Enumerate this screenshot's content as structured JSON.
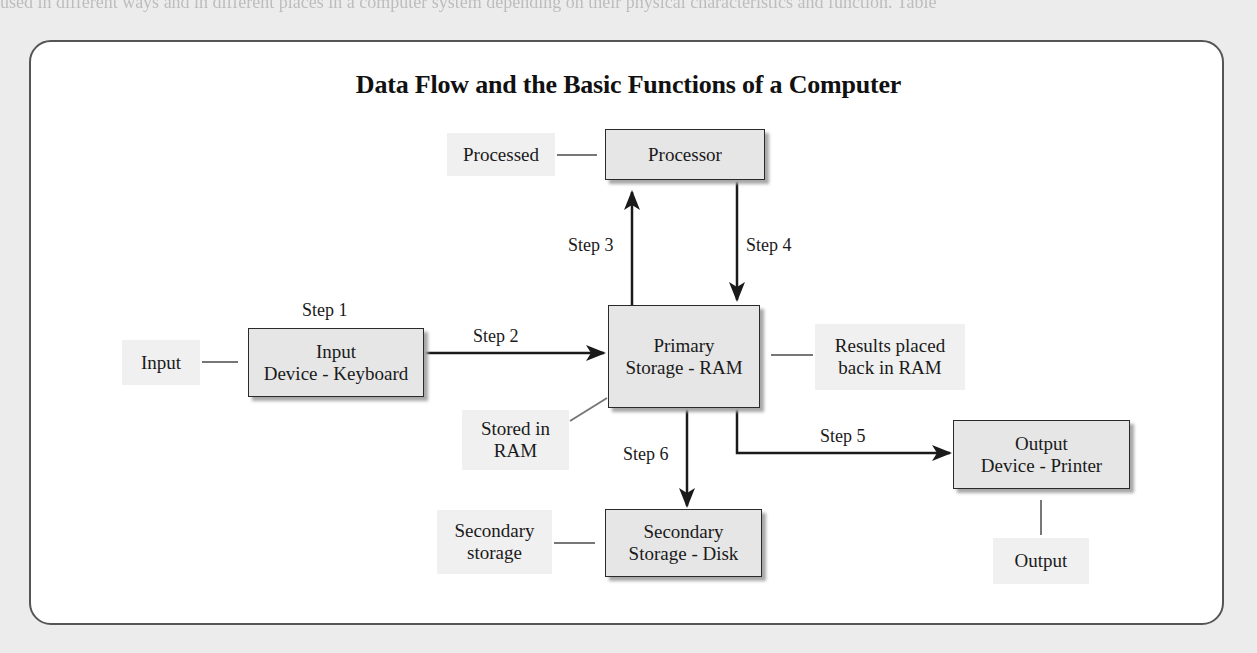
{
  "page": {
    "bleed_text": "used in different ways and in different places in a computer system depending on their physical characteristics and function. Table",
    "title": "Data Flow and the Basic Functions of a Computer"
  },
  "components": {
    "processor": {
      "line1": "Processor",
      "line2": ""
    },
    "primary": {
      "line1": "Primary",
      "line2": "Storage - RAM"
    },
    "input_device": {
      "line1": "Input",
      "line2": "Device - Keyboard"
    },
    "output_device": {
      "line1": "Output",
      "line2": "Device - Printer"
    },
    "secondary": {
      "line1": "Secondary",
      "line2": "Storage - Disk"
    }
  },
  "functions": {
    "input": {
      "line1": "Input",
      "line2": ""
    },
    "processed": {
      "line1": "Processed",
      "line2": ""
    },
    "results": {
      "line1": "Results placed",
      "line2": "back in RAM"
    },
    "stored": {
      "line1": "Stored in",
      "line2": "RAM"
    },
    "secondary_storage": {
      "line1": "Secondary",
      "line2": "storage"
    },
    "output": {
      "line1": "Output",
      "line2": ""
    }
  },
  "steps": {
    "s1": "Step 1",
    "s2": "Step 2",
    "s3": "Step 3",
    "s4": "Step 4",
    "s5": "Step 5",
    "s6": "Step 6"
  },
  "colors": {
    "box_fill": "#e6e6e6",
    "label_fill": "#f0f0f0",
    "line": "#1a1a1a",
    "frame_border": "#555555"
  }
}
